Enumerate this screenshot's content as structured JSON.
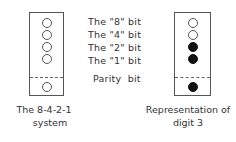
{
  "left_panel": {
    "caption_line1": "The 8-4-2-1",
    "caption_line2": "system",
    "bits": [
      {
        "name": "8",
        "state": "empty"
      },
      {
        "name": "4",
        "state": "empty"
      },
      {
        "name": "2",
        "state": "empty"
      },
      {
        "name": "1",
        "state": "empty"
      },
      {
        "name": "parity",
        "state": "empty"
      }
    ]
  },
  "labels": [
    "The \"8\" bit",
    "The \"4\" bit",
    "The \"2\" bit",
    "The \"1\" bit",
    "Parity  bit"
  ],
  "right_panel": {
    "caption_line1": "Representation of",
    "caption_line2": "digit 3",
    "bits": [
      {
        "name": "8",
        "state": "empty"
      },
      {
        "name": "4",
        "state": "empty"
      },
      {
        "name": "2",
        "state": "filled"
      },
      {
        "name": "1",
        "state": "filled"
      },
      {
        "name": "parity",
        "state": "filled"
      }
    ]
  }
}
